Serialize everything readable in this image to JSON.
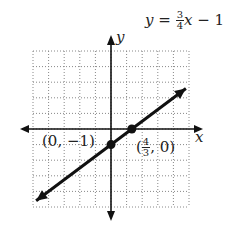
{
  "chart_data": {
    "type": "line",
    "equation": {
      "lhs": "y",
      "eq": "=",
      "num": "3",
      "den": "4",
      "var": "x",
      "rest": "− 1"
    },
    "xlabel": "x",
    "ylabel": "y",
    "xlim": [
      -5,
      5
    ],
    "ylim": [
      -5,
      5
    ],
    "grid": true,
    "slope": 0.75,
    "intercept": -1,
    "series": [
      {
        "name": "y = 3/4 x - 1",
        "x": [
          -4.8,
          4.8
        ],
        "y": [
          -4.6,
          2.6
        ]
      }
    ],
    "points": [
      {
        "label": "(0, −1)",
        "x": 0,
        "y": -1
      },
      {
        "label": "(4/3, 0)",
        "x": 1.3333,
        "y": 0
      }
    ]
  },
  "labels": {
    "y_axis": "y",
    "x_axis": "x",
    "point1": "(0, −1)",
    "point2_open": "(",
    "point2_num": "4",
    "point2_den": "3",
    "point2_close": ", 0)"
  }
}
